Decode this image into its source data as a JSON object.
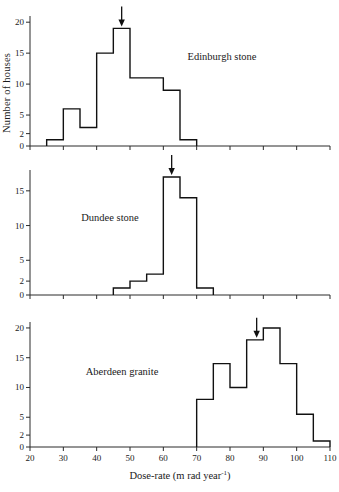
{
  "figure": {
    "ylabel": "Number of houses",
    "xlabel_main": "Dose-rate (m rad year",
    "xlabel_exp": "-1",
    "xlabel_close": ")"
  },
  "axis": {
    "x_min": 20,
    "x_max": 110,
    "x_ticks": [
      20,
      30,
      40,
      50,
      60,
      70,
      80,
      90,
      100,
      110
    ],
    "x_tick_labels": [
      "20",
      "30",
      "40",
      "50",
      "60",
      "70",
      "80",
      "90",
      "100",
      "110"
    ]
  },
  "chart_data": [
    {
      "type": "bar",
      "title": "Edinburgh stone",
      "xlabel": "Dose-rate (m rad year-1)",
      "ylabel": "Number of houses",
      "xlim": [
        20,
        110
      ],
      "ylim": [
        0,
        21
      ],
      "yticks": [
        0,
        2,
        5,
        10,
        15,
        20
      ],
      "ytick_labels": [
        "0",
        "2",
        "5",
        "10",
        "15",
        "20"
      ],
      "bin_width": 5,
      "bin_edges": [
        25,
        30,
        35,
        40,
        45,
        50,
        55,
        60,
        65,
        70
      ],
      "categories": [
        "25-30",
        "30-35",
        "35-40",
        "40-45",
        "45-50",
        "50-55",
        "55-60",
        "60-65",
        "65-70"
      ],
      "values": [
        1,
        6,
        3,
        15,
        19,
        11,
        11,
        9,
        1
      ],
      "mean_marker": 47.5,
      "grid": false,
      "legend": "none"
    },
    {
      "type": "bar",
      "title": "Dundee stone",
      "xlabel": "Dose-rate (m rad year-1)",
      "ylabel": "Number of houses",
      "xlim": [
        20,
        110
      ],
      "ylim": [
        0,
        18
      ],
      "yticks": [
        0,
        2,
        5,
        10,
        15
      ],
      "ytick_labels": [
        "0",
        "2",
        "5",
        "10",
        "15"
      ],
      "bin_width": 5,
      "bin_edges": [
        45,
        50,
        55,
        60,
        65,
        70,
        75
      ],
      "categories": [
        "45-50",
        "50-55",
        "55-60",
        "60-65",
        "65-70",
        "70-75"
      ],
      "values": [
        1,
        2,
        3,
        17,
        14,
        1
      ],
      "mean_marker": 62.5,
      "grid": false,
      "legend": "none"
    },
    {
      "type": "bar",
      "title": "Aberdeen granite",
      "xlabel": "Dose-rate (m rad year-1)",
      "ylabel": "Number of houses",
      "xlim": [
        20,
        110
      ],
      "ylim": [
        0,
        21
      ],
      "yticks": [
        0,
        2,
        5,
        10,
        15,
        20
      ],
      "ytick_labels": [
        "0",
        "2",
        "5",
        "10",
        "15",
        "20"
      ],
      "bin_width": 5,
      "bin_edges": [
        70,
        75,
        80,
        85,
        90,
        95,
        100,
        105,
        110
      ],
      "categories": [
        "70-75",
        "75-80",
        "80-85",
        "85-90",
        "90-95",
        "95-100",
        "100-105",
        "105-110"
      ],
      "values": [
        8,
        14,
        10,
        18,
        20,
        14,
        5.5,
        1
      ],
      "mean_marker": 88,
      "grid": false,
      "legend": "none"
    }
  ]
}
